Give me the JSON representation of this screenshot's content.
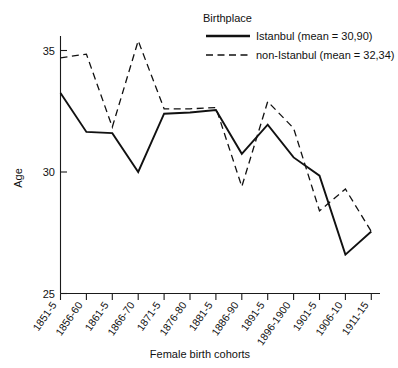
{
  "chart_data": {
    "type": "line",
    "title": "",
    "xlabel": "Female birth cohorts",
    "ylabel": "Age",
    "ylim": [
      25,
      36
    ],
    "yticks": [
      25,
      30,
      35
    ],
    "grid": false,
    "legend_position": "top-right",
    "legend_title": "Birthplace",
    "categories": [
      "1851-5",
      "1856-60",
      "1861-5",
      "1866-70",
      "1871-5",
      "1876-80",
      "1881-5",
      "1886-90",
      "1891-5",
      "1896-1900",
      "1901-5",
      "1906-10",
      "1911-15"
    ],
    "series": [
      {
        "name": "Istanbul (mean = 30,90)",
        "short_name": "Istanbul",
        "mean": "30,90",
        "style": "solid",
        "values": [
          33.25,
          31.65,
          31.6,
          30.0,
          32.4,
          32.45,
          32.55,
          30.75,
          31.95,
          30.6,
          29.85,
          26.6,
          27.55
        ]
      },
      {
        "name": "non-Istanbul (mean = 32,34)",
        "short_name": "non-Istanbul",
        "mean": "32,34",
        "style": "dashed",
        "values": [
          34.7,
          34.85,
          31.85,
          35.4,
          32.6,
          32.6,
          32.65,
          29.4,
          32.9,
          31.8,
          28.4,
          29.3,
          27.55
        ]
      }
    ]
  },
  "legend": {
    "title": "Birthplace",
    "entries": [
      {
        "label": "Istanbul (mean = 30,90)",
        "style": "solid"
      },
      {
        "label": "non-Istanbul (mean = 32,34)",
        "style": "dashed"
      }
    ]
  },
  "axes": {
    "y_title": "Age",
    "x_title": "Female birth cohorts",
    "y_tick_labels": [
      "35",
      "30",
      "25"
    ]
  }
}
